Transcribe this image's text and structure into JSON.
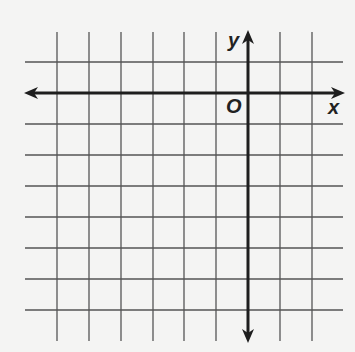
{
  "diagram": {
    "type": "coordinate-plane",
    "labels": {
      "x_axis": "x",
      "y_axis": "y",
      "origin": "O"
    },
    "grid": {
      "vertical_lines_x": [
        57,
        89,
        121,
        153,
        184,
        216,
        280,
        312
      ],
      "horizontal_lines_y": [
        62,
        124,
        155,
        186,
        217,
        248,
        279,
        310
      ],
      "vertical_span": [
        32,
        341
      ],
      "horizontal_span": [
        25,
        343
      ],
      "line_color": "#555555"
    },
    "axes": {
      "x_axis_y": 93,
      "x_axis_span": [
        24,
        345
      ],
      "y_axis_x": 248,
      "y_axis_span": [
        30,
        343
      ],
      "color": "#1e1e1e"
    },
    "colors": {
      "background": "#f4f4f3"
    }
  }
}
